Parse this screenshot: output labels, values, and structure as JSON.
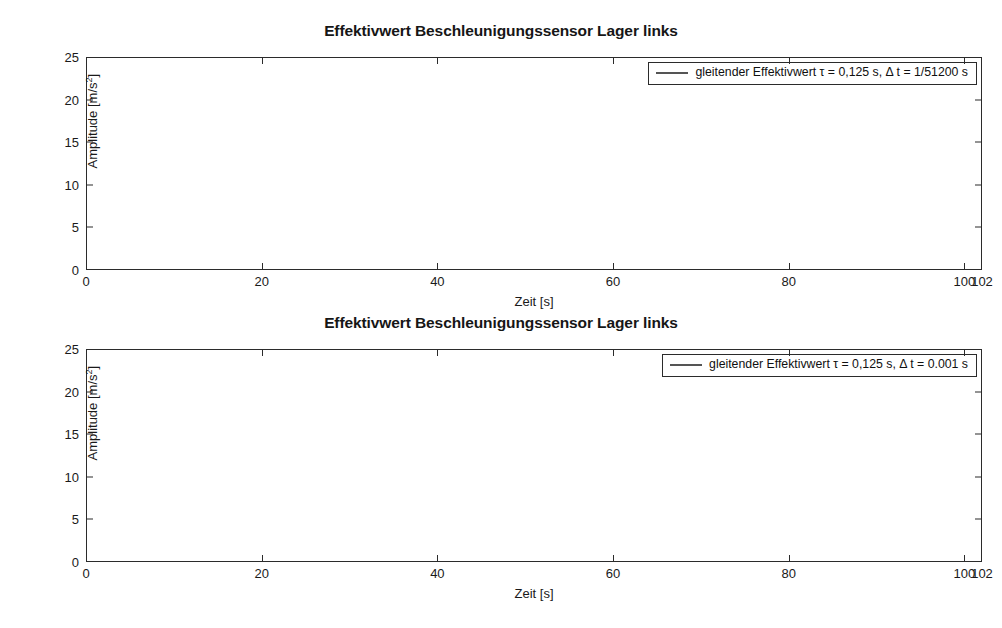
{
  "figures": [
    {
      "title": "Effektivwert Beschleunigungssensor Lager links",
      "legend": "gleitender Effektivwert τ = 0,125 s, Δ t = 1/51200 s"
    },
    {
      "title": "Effektivwert Beschleunigungssensor Lager links",
      "legend": "gleitender Effektivwert τ = 0,125 s, Δ t = 0.001 s"
    }
  ],
  "axes": {
    "xlabel": "Zeit [s]",
    "ylabel_prefix": "Amplitude [m/s",
    "ylabel_sup": "2",
    "ylabel_suffix": "]",
    "xticks": [
      0,
      20,
      40,
      60,
      80,
      100,
      102
    ],
    "yticks": [
      0,
      5,
      10,
      15,
      20,
      25
    ]
  },
  "style": {
    "line_color": "#555555",
    "axis_color": "#2b2b2b",
    "grid_color": "#d8d8d8",
    "background": "#ffffff"
  },
  "chart_data": [
    {
      "type": "line",
      "title": "Effektivwert Beschleunigungssensor Lager links",
      "xlabel": "Zeit [s]",
      "ylabel": "Amplitude [m/s^2]",
      "xlim": [
        0,
        102
      ],
      "ylim": [
        0,
        25
      ],
      "xticks": [
        0,
        20,
        40,
        60,
        80,
        100,
        102
      ],
      "yticks": [
        0,
        5,
        10,
        15,
        20,
        25
      ],
      "grid": true,
      "legend_position": "upper right",
      "series": [
        {
          "name": "gleitender Effektivwert τ = 0,125 s, Δ t = 1/51200 s",
          "color": "#555555",
          "envelope_x": [
            0,
            5,
            10,
            15,
            20,
            24,
            28,
            32,
            36,
            39,
            40.5,
            41.2,
            42,
            44,
            47,
            50,
            52,
            55,
            58,
            60,
            61.5,
            63,
            64.5,
            65.2,
            66,
            67.5,
            69,
            70.5,
            72,
            73,
            74.5,
            76,
            77.5,
            79,
            80.5,
            82,
            83.5,
            85,
            86.5,
            88,
            89.5,
            91,
            92.5,
            94,
            95.5,
            97,
            98.5,
            99.6,
            100.2,
            101,
            102
          ],
          "envelope_y": [
            0.12,
            0.14,
            0.17,
            0.2,
            0.25,
            0.35,
            0.5,
            0.65,
            0.8,
            0.95,
            1.3,
            1.05,
            0.85,
            1.0,
            1.25,
            1.3,
            1.2,
            1.25,
            1.35,
            1.5,
            2.6,
            2.8,
            2.9,
            4.2,
            5.0,
            5.3,
            5.1,
            6.2,
            9.2,
            8.6,
            9.3,
            10.3,
            12.0,
            12.5,
            13.6,
            15.0,
            14.0,
            13.6,
            12.0,
            10.8,
            10.2,
            9.4,
            8.0,
            6.4,
            4.2,
            3.0,
            2.4,
            5.6,
            8.8,
            2.2,
            1.05
          ],
          "peak_value": 22.2,
          "peak_time": 82,
          "noise_onset_time": 60
        }
      ]
    },
    {
      "type": "line",
      "title": "Effektivwert Beschleunigungssensor Lager links",
      "xlabel": "Zeit [s]",
      "ylabel": "Amplitude [m/s^2]",
      "xlim": [
        0,
        102
      ],
      "ylim": [
        0,
        25
      ],
      "xticks": [
        0,
        20,
        40,
        60,
        80,
        100,
        102
      ],
      "yticks": [
        0,
        5,
        10,
        15,
        20,
        25
      ],
      "grid": true,
      "legend_position": "upper right",
      "series": [
        {
          "name": "gleitender Effektivwert τ = 0,125 s, Δ t = 0.001 s",
          "color": "#555555",
          "envelope_x": [
            0,
            5,
            10,
            15,
            20,
            24,
            28,
            32,
            36,
            39,
            40.5,
            41.2,
            42,
            44,
            47,
            50,
            52,
            55,
            58,
            60,
            61.5,
            63,
            64.5,
            65.2,
            66,
            67.5,
            69,
            70.5,
            72,
            73,
            74.5,
            76,
            77.5,
            79,
            80.5,
            82,
            83.5,
            85,
            86.5,
            88,
            89.5,
            91,
            92.5,
            94,
            95.5,
            97,
            98.5,
            99.6,
            100.2,
            101,
            102
          ],
          "envelope_y": [
            0.12,
            0.14,
            0.17,
            0.2,
            0.25,
            0.35,
            0.5,
            0.65,
            0.8,
            0.95,
            1.3,
            1.05,
            0.85,
            1.0,
            1.25,
            1.3,
            1.2,
            1.25,
            1.35,
            1.5,
            2.6,
            2.8,
            2.9,
            4.2,
            5.0,
            5.3,
            5.1,
            6.2,
            9.2,
            8.6,
            9.3,
            10.3,
            12.0,
            12.5,
            13.6,
            15.0,
            14.0,
            13.6,
            12.0,
            10.8,
            10.2,
            9.4,
            8.0,
            6.4,
            4.2,
            3.0,
            2.4,
            5.6,
            8.8,
            2.2,
            1.05
          ],
          "peak_value": 21.8,
          "peak_time": 82,
          "noise_onset_time": 60
        }
      ]
    }
  ]
}
